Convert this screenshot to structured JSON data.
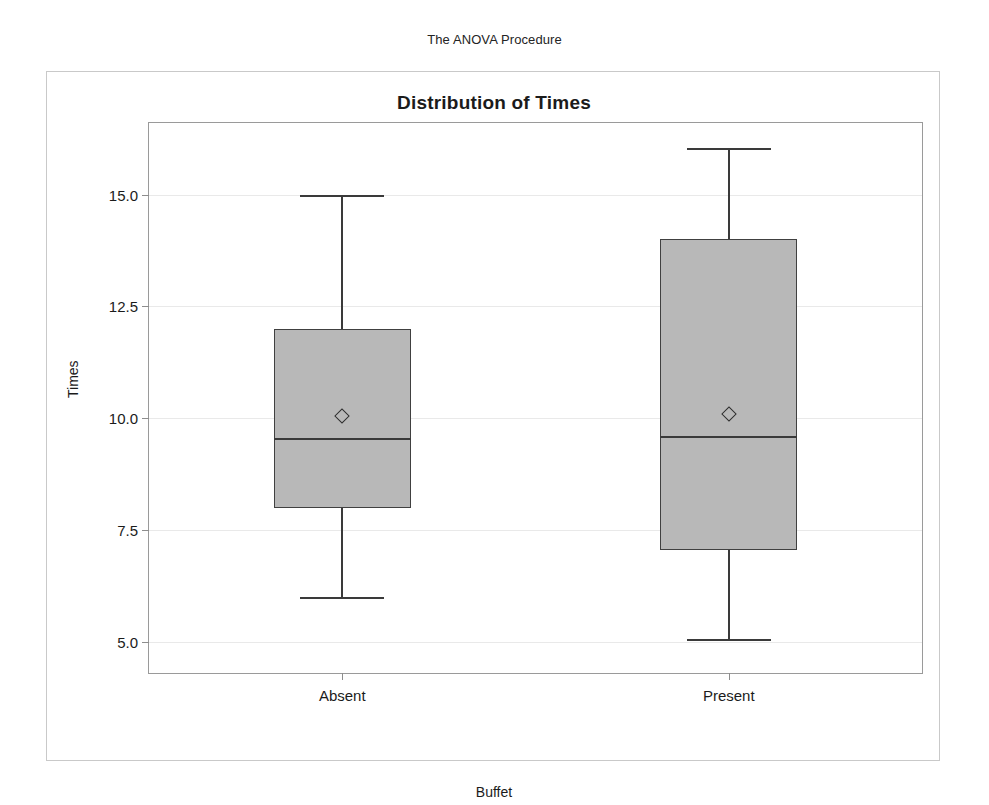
{
  "page": {
    "procedure_title": "The ANOVA Procedure"
  },
  "chart_data": {
    "type": "box",
    "title": "Distribution of Times",
    "xlabel": "Buffet",
    "ylabel": "Times",
    "ylim": [
      4.3,
      16.6
    ],
    "yticks": [
      5.0,
      7.5,
      10.0,
      12.5,
      15.0
    ],
    "ytick_labels": [
      "5.0",
      "7.5",
      "10.0",
      "12.5",
      "15.0"
    ],
    "grid": true,
    "grid_axis": "y",
    "legend": "none",
    "categories": [
      "Absent",
      "Present"
    ],
    "boxes": [
      {
        "category": "Absent",
        "whisker_low": 6.0,
        "q1": 8.0,
        "median": 9.55,
        "q3": 12.0,
        "whisker_high": 15.0,
        "mean": 10.05
      },
      {
        "category": "Present",
        "whisker_low": 5.05,
        "q1": 7.05,
        "median": 9.6,
        "q3": 14.0,
        "whisker_high": 16.05,
        "mean": 10.1
      }
    ],
    "colors": {
      "box_fill": "#b8b8b8",
      "box_edge": "#404040",
      "median": "#3a3a3a",
      "whisker": "#3a3a3a",
      "mean_marker": "#2f2f2f",
      "grid": "#e9e9e9",
      "frame": "#9a9a9a",
      "outer_frame": "#c9c9c9"
    }
  }
}
